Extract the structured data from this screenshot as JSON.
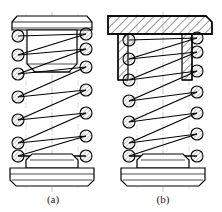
{
  "figure": {
    "kind": "engineering-drawing",
    "background_color": "#ffffff",
    "line_color": "#000000",
    "centerline_color": "#b0a8a8",
    "hatch_color": "#1a1a1a",
    "coil_fill": "#d8d8d8",
    "panels": [
      {
        "id": "panel-a",
        "label": "(a)",
        "label_x": 53,
        "label_y": 200,
        "origin_x": 8,
        "center_x": 52,
        "top_cap": {
          "name": "flat-top-plate",
          "sectioned": false,
          "x": 12,
          "y": 16,
          "width": 80,
          "height": 14
        },
        "plug": {
          "name": "tapered-plug",
          "x": 26,
          "y": 30,
          "width": 52,
          "height": 44,
          "taper_inset": 8,
          "taper_height": 8
        },
        "spring": {
          "name": "helical-compression-spring",
          "top_y": 32,
          "bottom_y": 162,
          "left_x": 18,
          "right_x": 86,
          "coil_radius": 6,
          "left_coil_ys": [
            36,
            55,
            74,
            97,
            120,
            143,
            156
          ],
          "right_coil_ys": [
            34,
            49,
            67,
            90,
            113,
            136,
            156
          ],
          "turns": 7
        },
        "base": {
          "name": "base-plate",
          "x": 10,
          "y": 168,
          "width": 84,
          "height": 18,
          "boss_x": 26,
          "boss_y": 157,
          "boss_width": 52,
          "boss_height": 11
        }
      },
      {
        "id": "panel-b",
        "label": "(b)",
        "label_x": 163,
        "label_y": 200,
        "origin_x": 112,
        "center_x": 163,
        "top_cap": {
          "name": "sectioned-cup-housing",
          "sectioned": true,
          "x": 108,
          "y": 16,
          "width": 104,
          "height": 18,
          "wall_left_x": 118,
          "wall_right_x": 192,
          "wall_thickness": 10,
          "wall_bottom_y": 80,
          "hatch_spacing": 5,
          "hatch_angle_deg": 45
        },
        "spring": {
          "name": "helical-compression-spring",
          "top_y": 34,
          "bottom_y": 162,
          "left_x": 129,
          "right_x": 197,
          "coil_radius": 6,
          "left_coil_ys": [
            40,
            59,
            80,
            101,
            122,
            143,
            156
          ],
          "right_coil_ys": [
            38,
            52,
            71,
            92,
            113,
            134,
            156
          ],
          "turns": 7
        },
        "base": {
          "name": "base-plate",
          "x": 121,
          "y": 168,
          "width": 84,
          "height": 18,
          "boss_x": 137,
          "boss_y": 157,
          "boss_width": 52,
          "boss_height": 11
        }
      }
    ]
  }
}
